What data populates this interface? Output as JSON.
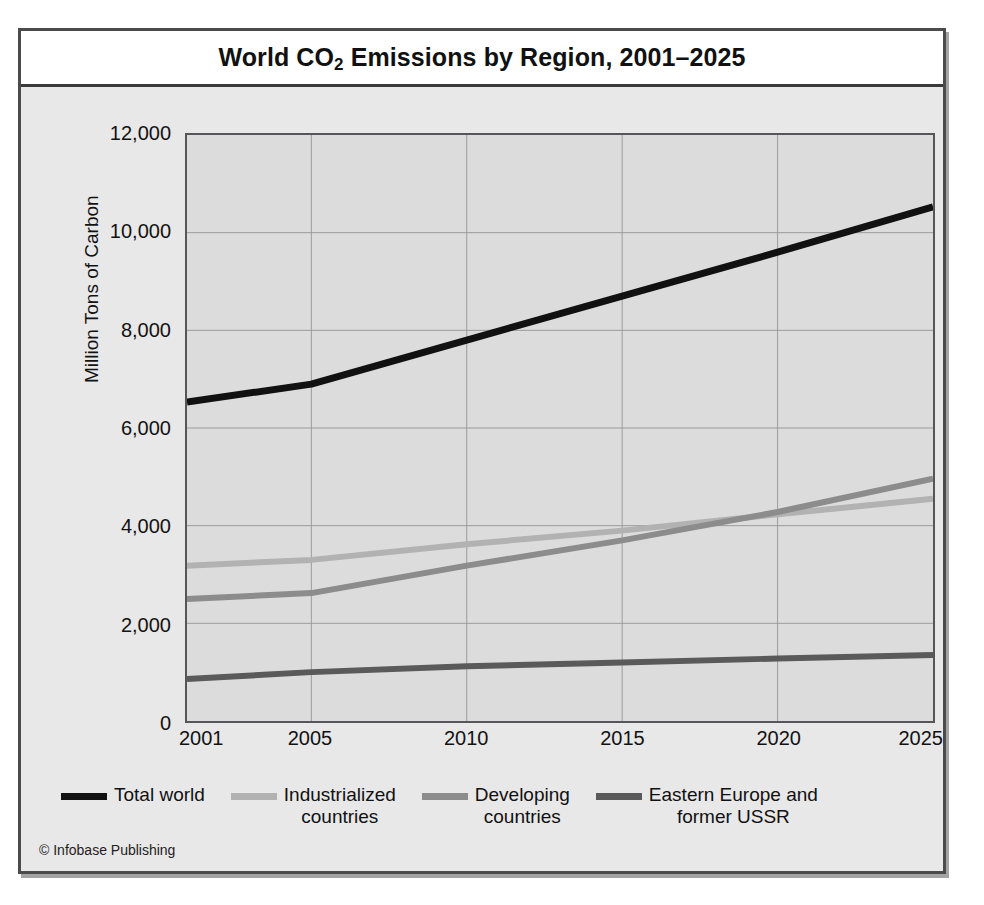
{
  "figure": {
    "title_main": "World CO",
    "title_sub": "2",
    "title_rest": " Emissions by Region, 2001–2025",
    "title_full": "World CO2 Emissions by Region, 2001–2025",
    "credit": "© Infobase Publishing",
    "background_color": "#e8e8e8",
    "plot_background_color": "#dcdcdc",
    "frame_color": "#4b4b4b"
  },
  "chart_data": {
    "type": "line",
    "title": "World CO2 Emissions by Region, 2001–2025",
    "xlabel": "",
    "ylabel": "Million Tons of Carbon",
    "xlim": [
      2001,
      2025
    ],
    "ylim": [
      0,
      12000
    ],
    "xticks": [
      2001,
      2005,
      2010,
      2015,
      2020,
      2025
    ],
    "xtick_labels": [
      "2001",
      "2005",
      "2010",
      "2015",
      "2020",
      "2025"
    ],
    "yticks": [
      0,
      2000,
      4000,
      6000,
      8000,
      10000,
      12000
    ],
    "ytick_labels": [
      "0",
      "2,000",
      "4,000",
      "6,000",
      "8,000",
      "10,000",
      "12,000"
    ],
    "grid": true,
    "grid_axis": "both",
    "legend_position": "below",
    "x": [
      2001,
      2005,
      2010,
      2015,
      2020,
      2025
    ],
    "series": [
      {
        "name": "Total world",
        "color": "#111111",
        "values": [
          6530,
          6900,
          7800,
          8700,
          9600,
          10530
        ]
      },
      {
        "name": "Industrialized countries",
        "color": "#b2b2b2",
        "values": [
          3180,
          3300,
          3620,
          3900,
          4230,
          4550
        ]
      },
      {
        "name": "Developing countries",
        "color": "#8c8c8c",
        "values": [
          2500,
          2620,
          3180,
          3700,
          4280,
          4960
        ]
      },
      {
        "name": "Eastern Europe and former USSR",
        "color": "#5a5a5a",
        "values": [
          860,
          1000,
          1120,
          1200,
          1280,
          1350
        ]
      }
    ]
  },
  "legend": {
    "items": [
      {
        "label_line1": "Total world",
        "label_line2": "",
        "color": "#111111"
      },
      {
        "label_line1": "Industrialized",
        "label_line2": "countries",
        "color": "#b2b2b2"
      },
      {
        "label_line1": "Developing",
        "label_line2": "countries",
        "color": "#8c8c8c"
      },
      {
        "label_line1": "Eastern Europe and",
        "label_line2": "former USSR",
        "color": "#5a5a5a"
      }
    ]
  }
}
